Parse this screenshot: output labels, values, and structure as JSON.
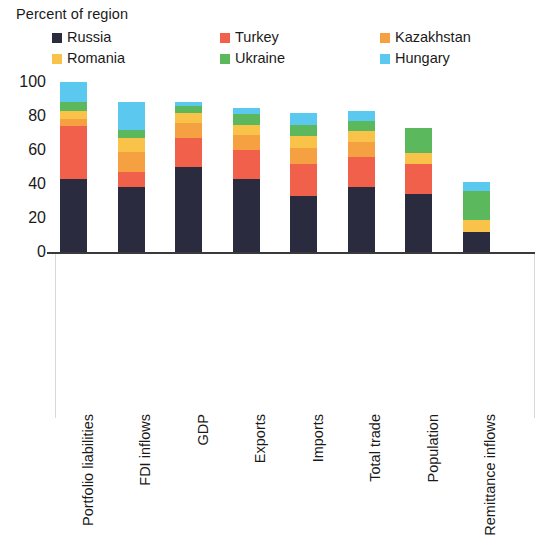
{
  "chart_data": {
    "type": "bar",
    "stacked": true,
    "title": "",
    "ylabel": "Percent of region",
    "xlabel": "",
    "ylim": [
      0,
      100
    ],
    "yticks": [
      0,
      20,
      40,
      60,
      80,
      100
    ],
    "grid": false,
    "legend_position": "top",
    "categories": [
      "Portfolio liabilities",
      "FDI inflows",
      "GDP",
      "Exports",
      "Imports",
      "Total trade",
      "Population",
      "Remittance inflows"
    ],
    "series": [
      {
        "name": "Russia",
        "color": "#2b2b40",
        "values": [
          43,
          38,
          50,
          43,
          33,
          38,
          34,
          12
        ]
      },
      {
        "name": "Turkey",
        "color": "#f0604a",
        "values": [
          31,
          9,
          17,
          17,
          19,
          18,
          18,
          0
        ]
      },
      {
        "name": "Kazakhstan",
        "color": "#f5a142",
        "values": [
          4,
          12,
          9,
          9,
          9,
          9,
          0,
          0
        ]
      },
      {
        "name": "Romania",
        "color": "#f9c349",
        "values": [
          5,
          8,
          6,
          6,
          7,
          6,
          6,
          7
        ]
      },
      {
        "name": "Ukraine",
        "color": "#5cb85c",
        "values": [
          5,
          5,
          4,
          6,
          7,
          6,
          15,
          17
        ]
      },
      {
        "name": "Hungary",
        "color": "#5bc8f0",
        "values": [
          12,
          16,
          2,
          4,
          7,
          6,
          0,
          5
        ]
      }
    ],
    "totals": [
      100,
      88,
      88,
      85,
      82,
      83,
      73,
      41
    ]
  },
  "axis": {
    "title": "Percent of region",
    "tick_labels": [
      "100",
      "80",
      "60",
      "40",
      "20",
      "0"
    ]
  },
  "legend": {
    "items": [
      {
        "label": "Russia",
        "color": "#2b2b40"
      },
      {
        "label": "Turkey",
        "color": "#f0604a"
      },
      {
        "label": "Kazakhstan",
        "color": "#f5a142"
      },
      {
        "label": "Romania",
        "color": "#f9c349"
      },
      {
        "label": "Ukraine",
        "color": "#5cb85c"
      },
      {
        "label": "Hungary",
        "color": "#5bc8f0"
      }
    ]
  }
}
